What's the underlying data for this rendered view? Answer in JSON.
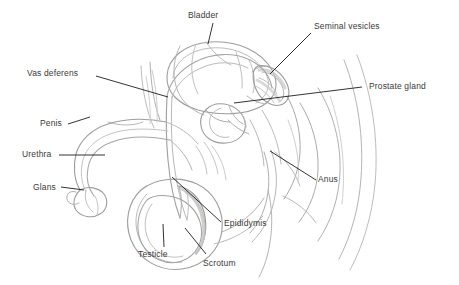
{
  "figure": {
    "style": "pencil sketch line drawing",
    "background_color": "#ffffff",
    "sketch_line_color": "#b4b4b4",
    "sketch_line_dark_color": "#8d8d8d",
    "shading_color": "#c9c6c4",
    "leader_line_color": "#1c1c1c",
    "label_text_color": "#3a3a3a",
    "width": 459,
    "height": 285
  },
  "labels": [
    {
      "id": "bladder",
      "text": "Bladder",
      "x": 188,
      "y": 10,
      "leader": {
        "x1": 213,
        "y1": 23,
        "x2": 208,
        "y2": 44
      }
    },
    {
      "id": "seminal-vesicles",
      "text": "Seminal vesicles",
      "x": 314,
      "y": 21,
      "leader": {
        "x1": 311,
        "y1": 33,
        "x2": 270,
        "y2": 74
      }
    },
    {
      "id": "vas-deferens",
      "text": "Vas deferens",
      "x": 27,
      "y": 68,
      "leader": {
        "x1": 96,
        "y1": 76,
        "x2": 168,
        "y2": 97
      }
    },
    {
      "id": "prostate-gland",
      "text": "Prostate gland",
      "x": 369,
      "y": 81,
      "leader": {
        "x1": 362,
        "y1": 87,
        "x2": 234,
        "y2": 103
      }
    },
    {
      "id": "penis",
      "text": "Penis",
      "x": 40,
      "y": 118,
      "leader": {
        "x1": 68,
        "y1": 124,
        "x2": 90,
        "y2": 117
      }
    },
    {
      "id": "urethra",
      "text": "Urethra",
      "x": 22,
      "y": 149,
      "leader": {
        "x1": 59,
        "y1": 155,
        "x2": 105,
        "y2": 155
      }
    },
    {
      "id": "glans",
      "text": "Glans",
      "x": 33,
      "y": 182,
      "leader": {
        "x1": 61,
        "y1": 187,
        "x2": 84,
        "y2": 190
      }
    },
    {
      "id": "anus",
      "text": "Anus",
      "x": 318,
      "y": 174,
      "leader": {
        "x1": 316,
        "y1": 180,
        "x2": 270,
        "y2": 151
      }
    },
    {
      "id": "epididymis",
      "text": "Epididymis",
      "x": 224,
      "y": 218,
      "leader": {
        "x1": 221,
        "y1": 222,
        "x2": 172,
        "y2": 177
      }
    },
    {
      "id": "testicle",
      "text": "Testicle",
      "x": 138,
      "y": 249,
      "leader": {
        "x1": 164,
        "y1": 247,
        "x2": 163,
        "y2": 224
      }
    },
    {
      "id": "scrotum",
      "text": "Scrotum",
      "x": 203,
      "y": 258,
      "leader": {
        "x1": 206,
        "y1": 254,
        "x2": 185,
        "y2": 228
      }
    }
  ]
}
